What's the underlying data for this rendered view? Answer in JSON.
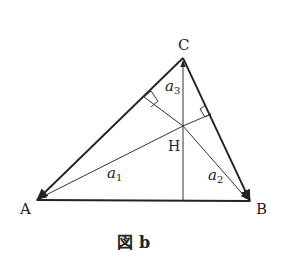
{
  "figure": {
    "caption_prefix": "図",
    "caption_letter": "b",
    "vertices": {
      "A": "A",
      "B": "B",
      "C": "C",
      "H": "H"
    },
    "vectors": {
      "a1": {
        "base": "a",
        "sub": "1"
      },
      "a2": {
        "base": "a",
        "sub": "2"
      },
      "a3": {
        "base": "a",
        "sub": "3"
      }
    }
  }
}
